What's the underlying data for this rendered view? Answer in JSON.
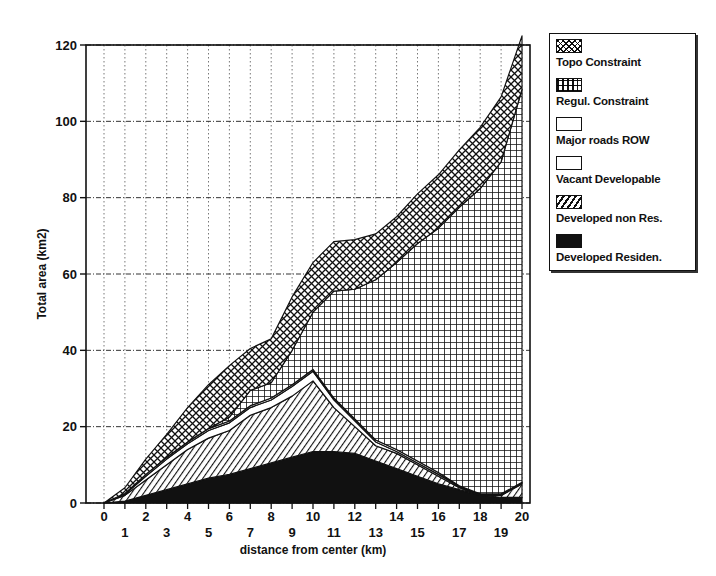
{
  "chart_data": {
    "type": "area",
    "stacked": true,
    "title": "",
    "xlabel": "distance from center (km)",
    "ylabel": "Total area (km2)",
    "xlim": [
      0,
      20
    ],
    "ylim": [
      0,
      120
    ],
    "x": [
      0,
      1,
      2,
      3,
      4,
      5,
      6,
      7,
      8,
      9,
      10,
      11,
      12,
      13,
      14,
      15,
      16,
      17,
      18,
      19,
      20
    ],
    "x_ticks_upper": [
      "0",
      "2",
      "4",
      "6",
      "8",
      "10",
      "12",
      "14",
      "16",
      "18",
      "20"
    ],
    "x_ticks_lower": [
      "1",
      "3",
      "5",
      "7",
      "9",
      "11",
      "13",
      "15",
      "17",
      "19"
    ],
    "y_ticks": [
      "0",
      "20",
      "40",
      "60",
      "80",
      "100",
      "120"
    ],
    "grid": {
      "vertical": true,
      "horizontal": true,
      "style": "dotted"
    },
    "legend_position": "right",
    "series": [
      {
        "name": "Developed Residen.",
        "pattern": "solid-black",
        "values": [
          0,
          0.5,
          2,
          3.5,
          5,
          6.5,
          7.5,
          9,
          10.5,
          12,
          13.5,
          13.5,
          13,
          11,
          9,
          7,
          5,
          3.5,
          2,
          1.5,
          1.5
        ]
      },
      {
        "name": "Developed non Res.",
        "pattern": "diagonal-hatch",
        "values": [
          0,
          1.5,
          4,
          6.5,
          9,
          10.5,
          11.5,
          14,
          14.5,
          16,
          18.5,
          11.5,
          7,
          4,
          4,
          3,
          2,
          0.5,
          0,
          0.5,
          3.5
        ]
      },
      {
        "name": "Vacant Developable",
        "pattern": "white",
        "values": [
          0,
          0.3,
          1,
          1.5,
          1.5,
          2,
          2,
          2,
          2,
          2.5,
          2.5,
          2,
          1.5,
          1,
          0.5,
          0.5,
          0.5,
          0.3,
          0.2,
          0.2,
          0.2
        ]
      },
      {
        "name": "Major roads ROW",
        "pattern": "white",
        "values": [
          0,
          0.2,
          0.5,
          0.5,
          0.5,
          0.5,
          0.5,
          0.5,
          0.5,
          0.5,
          0.5,
          0.5,
          0.5,
          0.5,
          0.5,
          0.5,
          0.5,
          0.2,
          0.2,
          0.2,
          0.2
        ]
      },
      {
        "name": "Regul. Constraint",
        "pattern": "square-grid",
        "values": [
          0,
          0,
          0,
          0,
          0,
          0,
          1,
          4,
          4,
          9,
          15,
          28,
          34,
          42,
          49,
          57,
          64,
          73,
          80,
          87,
          103
        ]
      },
      {
        "name": "Topo Constraint",
        "pattern": "cross-hatch",
        "values": [
          0,
          1.5,
          4,
          6,
          9,
          11.5,
          13.5,
          11,
          11.5,
          14,
          13,
          13,
          13,
          12,
          12,
          13,
          14,
          15,
          16,
          17,
          14
        ]
      }
    ]
  },
  "axes": {
    "xlabel": "distance from center (km)",
    "ylabel": "Total area (km2)"
  },
  "legend": {
    "items": [
      {
        "label": "Topo Constraint",
        "pattern": "cross-hatch"
      },
      {
        "label": "Regul. Constraint",
        "pattern": "square-grid"
      },
      {
        "label": "Major roads ROW",
        "pattern": "white"
      },
      {
        "label": "Vacant Developable",
        "pattern": "white"
      },
      {
        "label": "Developed non Res.",
        "pattern": "diagonal-hatch"
      },
      {
        "label": "Developed Residen.",
        "pattern": "solid-black"
      }
    ]
  },
  "colors": {
    "ink": "#111111",
    "paper": "#ffffff"
  }
}
